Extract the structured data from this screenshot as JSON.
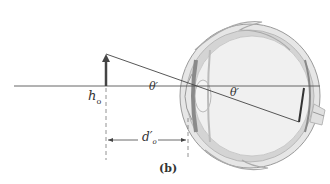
{
  "diagram": {
    "type": "eye-angular-size",
    "labels": {
      "object_height": "h",
      "object_height_sub": "o",
      "angle_outer": "θ′",
      "angle_inner": "θ′",
      "distance": "d′",
      "distance_sub": "o",
      "panel": "(b)"
    },
    "colors": {
      "line": "#555555",
      "arrow": "#444444",
      "eye_outer": "#d8d8d8",
      "eye_inner": "#eeeeee",
      "eye_dark": "#9a9a9a"
    }
  }
}
